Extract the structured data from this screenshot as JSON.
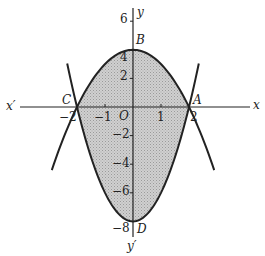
{
  "diagram": {
    "type": "region between two parabolas",
    "axes": {
      "x_label": "x",
      "x_neg_label": "x′",
      "y_label": "y",
      "y_neg_label": "y′",
      "origin_label": "O",
      "x_ticks": [
        {
          "value": -2,
          "label": "−2"
        },
        {
          "value": -1,
          "label": "−1"
        },
        {
          "value": 1,
          "label": "1"
        },
        {
          "value": 2,
          "label": "2"
        }
      ],
      "y_ticks": [
        {
          "value": 6,
          "label": "6"
        },
        {
          "value": 4,
          "label": "4"
        },
        {
          "value": 2,
          "label": "2"
        },
        {
          "value": -2,
          "label": "−2"
        },
        {
          "value": -4,
          "label": "−4"
        },
        {
          "value": -6,
          "label": "−6"
        },
        {
          "value": -8,
          "label": "−8"
        }
      ]
    },
    "curves": [
      {
        "name": "upper-parabola",
        "equation": "y = 4 − x²",
        "x_range": [
          -2.9,
          2.9
        ]
      },
      {
        "name": "lower-parabola",
        "equation": "y = 2x² − 8",
        "x_range": [
          -2.35,
          2.35
        ]
      }
    ],
    "points": [
      {
        "label": "A",
        "x": 2,
        "y": 0
      },
      {
        "label": "B",
        "x": 0,
        "y": 4
      },
      {
        "label": "C",
        "x": -2,
        "y": 0
      },
      {
        "label": "D",
        "x": 0,
        "y": -8
      }
    ],
    "shaded_region": "bounded between y = 4 − x² and y = 2x² − 8 for −2 ≤ x ≤ 2",
    "colors": {
      "shade": "#c8c8c8",
      "stroke": "#222222"
    }
  }
}
